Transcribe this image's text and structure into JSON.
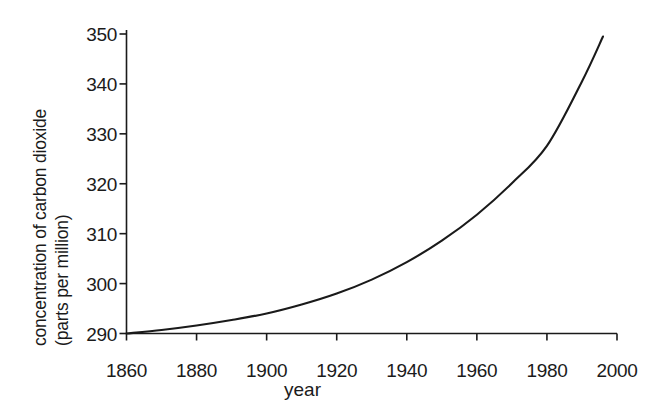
{
  "chart_data": {
    "type": "line",
    "title": "",
    "xlabel": "year",
    "ylabel": "concentration of carbon dioxide (parts per million)",
    "ylabel_lines": [
      "concentration of carbon dioxide",
      "(parts per million)"
    ],
    "xlim": [
      1860,
      2000
    ],
    "ylim": [
      290,
      350
    ],
    "xticks": [
      1860,
      1880,
      1900,
      1920,
      1940,
      1960,
      1980,
      2000
    ],
    "yticks": [
      290,
      300,
      310,
      320,
      330,
      340,
      350
    ],
    "grid": false,
    "legend": "none",
    "series": [
      {
        "name": "concentration of carbon dioxide",
        "color": "#1a1a1a",
        "x": [
          1860,
          1870,
          1880,
          1890,
          1900,
          1910,
          1920,
          1930,
          1940,
          1950,
          1960,
          1970,
          1980,
          1990,
          1996
        ],
        "values": [
          290.0,
          290.7,
          291.6,
          292.7,
          294.0,
          295.8,
          298.0,
          300.8,
          304.3,
          308.6,
          313.8,
          320.1,
          327.6,
          340.5,
          349.5
        ]
      }
    ]
  }
}
